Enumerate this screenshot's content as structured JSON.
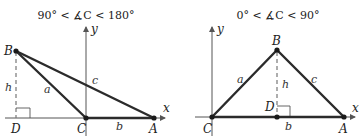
{
  "diagrams": [
    {
      "id": "obtuse",
      "title": "90° < ∡C < 180°",
      "axis_x_label": "x",
      "axis_y_label": "y",
      "vertices": {
        "A": "A",
        "B": "B",
        "C": "C",
        "D": "D"
      },
      "sides": {
        "a": "a",
        "b": "b",
        "c": "c",
        "h": "h"
      }
    },
    {
      "id": "acute",
      "title": "0° < ∡C < 90°",
      "axis_x_label": "x",
      "axis_y_label": "y",
      "vertices": {
        "A": "A",
        "B": "B",
        "C": "C",
        "D": "D"
      },
      "sides": {
        "a": "a",
        "b": "b",
        "c": "c",
        "h": "h"
      }
    }
  ]
}
